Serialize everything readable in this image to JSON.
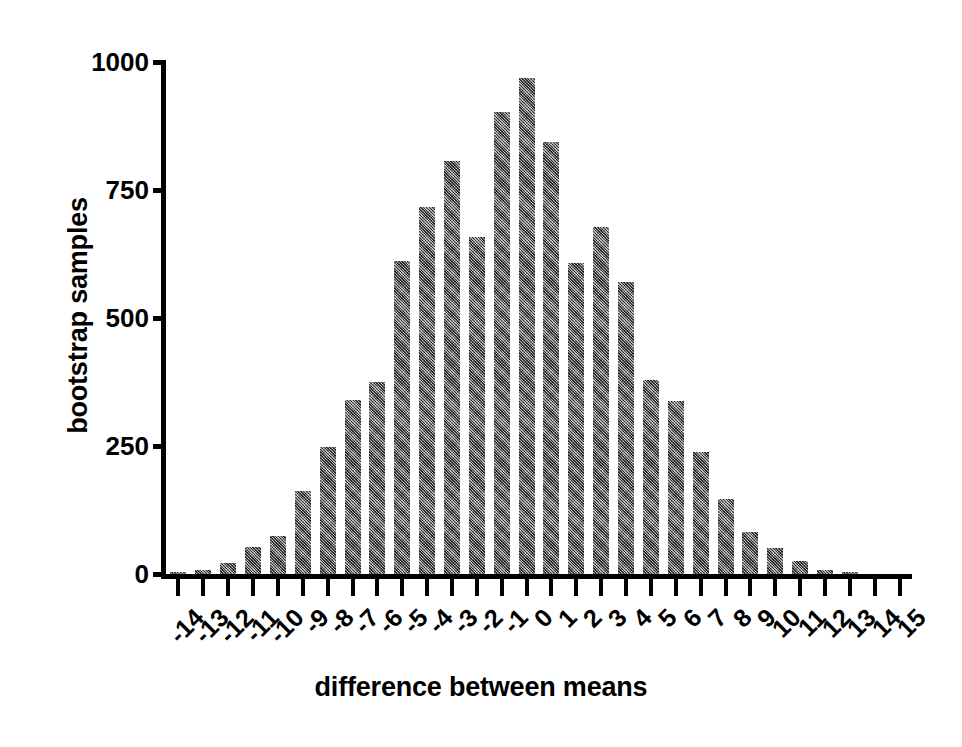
{
  "chart_data": {
    "type": "bar",
    "title": "",
    "xlabel": "difference between means",
    "ylabel": "bootstrap samples",
    "categories": [
      "-14",
      "-13",
      "-12",
      "-11",
      "-10",
      "-9",
      "-8",
      "-7",
      "-6",
      "-5",
      "-4",
      "-3",
      "-2",
      "-1",
      "0",
      "1",
      "2",
      "3",
      "4",
      "5",
      "6",
      "7",
      "8",
      "9",
      "10",
      "11",
      "12",
      "13",
      "14",
      "15"
    ],
    "values": [
      3,
      8,
      22,
      52,
      75,
      163,
      249,
      339,
      375,
      611,
      716,
      807,
      659,
      903,
      968,
      843,
      607,
      678,
      571,
      378,
      338,
      239,
      146,
      82,
      51,
      26,
      8,
      3,
      0,
      0
    ],
    "ylim": [
      0,
      1000
    ],
    "yticks": [
      0,
      250,
      500,
      750,
      1000
    ],
    "yticklabels": [
      "0",
      "250",
      "500",
      "750",
      "1000"
    ],
    "grid": false,
    "legend": null,
    "bar_color": "#6b6b6b",
    "axis_color": "#000000",
    "background": "#ffffff"
  }
}
